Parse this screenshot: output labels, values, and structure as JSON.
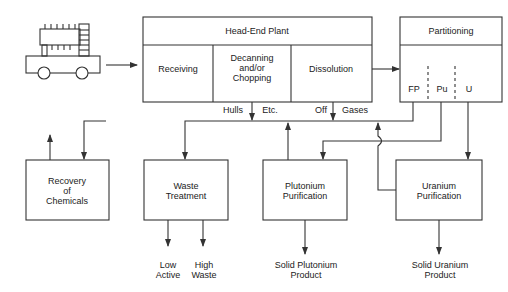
{
  "diagram": {
    "head_end_plant": {
      "title": "Head-End Plant",
      "stages": [
        "Receiving",
        "Decanning and/or Chopping",
        "Dissolution"
      ],
      "stage_lines": {
        "receiving": [
          "Receiving"
        ],
        "decanning": [
          "Decanning",
          "and/or",
          "Chopping"
        ],
        "dissolution": [
          "Dissolution"
        ]
      }
    },
    "partitioning": {
      "title": "Partitioning",
      "streams": [
        "FP",
        "Pu",
        "U"
      ]
    },
    "flow_labels": {
      "hulls": "Hulls",
      "etc": "Etc.",
      "off": "Off",
      "gases": "Gases"
    },
    "boxes": {
      "recovery": [
        "Recovery",
        "of",
        "Chemicals"
      ],
      "waste": [
        "Waste",
        "Treatment"
      ],
      "plutonium": [
        "Plutonium",
        "Purification"
      ],
      "uranium": [
        "Uranium",
        "Purification"
      ]
    },
    "outputs": {
      "low_active": [
        "Low",
        "Active"
      ],
      "high_waste": [
        "High",
        "Waste"
      ],
      "plutonium_product": [
        "Solid Plutonium",
        "Product"
      ],
      "uranium_product": [
        "Solid Uranium",
        "Product"
      ]
    },
    "icons": {
      "truck": "fuel-transport-truck-icon"
    },
    "colors": {
      "line": "#333333",
      "background": "#ffffff"
    }
  }
}
